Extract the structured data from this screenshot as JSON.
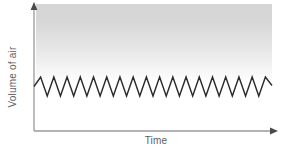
{
  "chart_data": {
    "type": "line",
    "title": "",
    "subtitle": "",
    "xlabel": "Time",
    "ylabel": "Volume of air",
    "grid": false,
    "legend": null,
    "legend_position": "none",
    "x_tick_labels": [],
    "y_tick_labels": [],
    "axis_style": {
      "x_axis_arrow": true,
      "y_axis_arrow": true,
      "axis_color": "#9a9a9a",
      "ticks": false
    },
    "plot_background": {
      "description": "vertical gray gradient band fading from gray at top to white at bottom",
      "top_color": "#d6d6d6",
      "bottom_color": "#ffffff"
    },
    "annotations": [],
    "series": [
      {
        "name": "Tidal breathing volume",
        "waveform": "sawtooth-zigzag",
        "color": "#2b2b2b",
        "line_width": 1.4,
        "cycles": 18,
        "peak_value": 1,
        "trough_value": 0,
        "x_range_px": [
          34,
          272
        ],
        "peak_y_px": 77,
        "trough_y_px": 96,
        "values": [
          0.5,
          1,
          0,
          1,
          0,
          1,
          0,
          1,
          0,
          1,
          0,
          1,
          0,
          1,
          0,
          1,
          0,
          1,
          0,
          1,
          0,
          1,
          0,
          1,
          0,
          1,
          0,
          1,
          0,
          1,
          0,
          1,
          0,
          1,
          0,
          1,
          0.55
        ]
      }
    ],
    "xlim": [
      0,
      1
    ],
    "ylim": [
      0,
      1
    ]
  }
}
